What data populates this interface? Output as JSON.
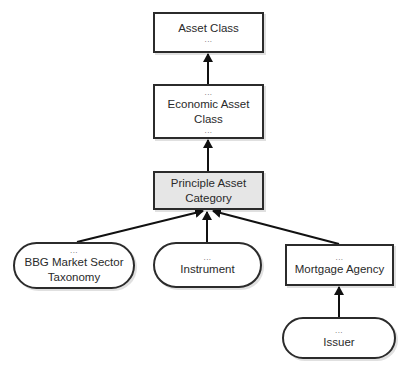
{
  "diagram": {
    "type": "hierarchy",
    "nodes": [
      {
        "id": "asset_class",
        "label": "Asset Class",
        "dots_top": "",
        "dots_bottom": "...",
        "shape": "rect",
        "fill": "#ffffff"
      },
      {
        "id": "economic_asset_class",
        "label": "Economic Asset\nClass",
        "dots_top": "...",
        "dots_bottom": "...",
        "shape": "rect",
        "fill": "#ffffff"
      },
      {
        "id": "principle_asset_category",
        "label": "Principle Asset\nCategory",
        "dots_top": "",
        "dots_bottom": "",
        "shape": "rect",
        "fill": "#e6e6e6"
      },
      {
        "id": "bbg_market_sector_taxonomy",
        "label": "BBG Market Sector\nTaxonomy",
        "dots_top": "...",
        "dots_bottom": "",
        "shape": "pill",
        "fill": "#ffffff"
      },
      {
        "id": "instrument",
        "label": "Instrument",
        "dots_top": "...",
        "dots_bottom": "",
        "shape": "pill",
        "fill": "#ffffff"
      },
      {
        "id": "mortgage_agency",
        "label": "Mortgage Agency",
        "dots_top": "...",
        "dots_bottom": "",
        "shape": "rect",
        "fill": "#ffffff"
      },
      {
        "id": "issuer",
        "label": "Issuer",
        "dots_top": "...",
        "dots_bottom": "",
        "shape": "pill",
        "fill": "#ffffff"
      }
    ],
    "edges": [
      {
        "from": "economic_asset_class",
        "to": "asset_class"
      },
      {
        "from": "principle_asset_category",
        "to": "economic_asset_class"
      },
      {
        "from": "bbg_market_sector_taxonomy",
        "to": "principle_asset_category"
      },
      {
        "from": "instrument",
        "to": "principle_asset_category"
      },
      {
        "from": "mortgage_agency",
        "to": "principle_asset_category"
      },
      {
        "from": "issuer",
        "to": "mortgage_agency"
      }
    ],
    "colors": {
      "stroke": "#2b2b2b",
      "text": "#2a2a2a",
      "shaded_fill": "#e6e6e6",
      "background": "#ffffff"
    }
  }
}
